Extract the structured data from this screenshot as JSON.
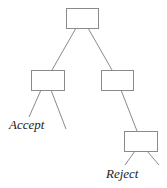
{
  "diagram": {
    "type": "decision-tree",
    "labels": {
      "accept": "Accept",
      "reject": "Reject"
    },
    "colors": {
      "stroke": "#8a8a8a",
      "text": "#222222",
      "background": "#ffffff"
    }
  }
}
